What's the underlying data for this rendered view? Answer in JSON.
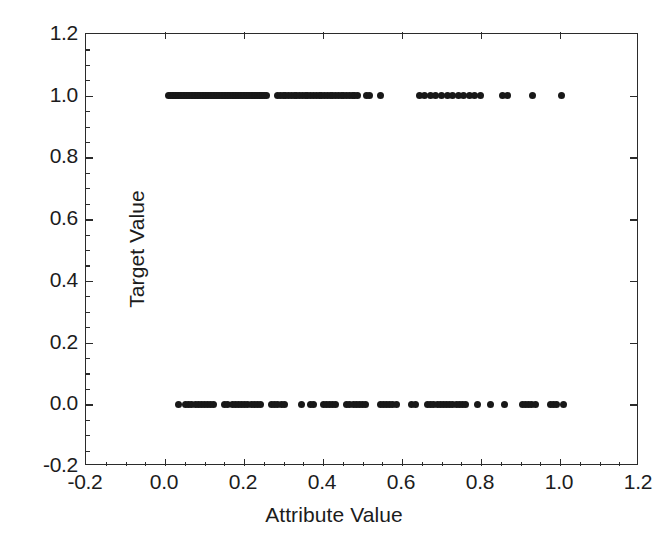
{
  "chart_data": {
    "type": "scatter",
    "title": "",
    "xlabel": "Attribute Value",
    "ylabel": "Target Value",
    "xlim": [
      -0.2,
      1.2
    ],
    "ylim": [
      -0.2,
      1.2
    ],
    "xticks": [
      -0.2,
      0.0,
      0.2,
      0.4,
      0.6,
      0.8,
      1.0,
      1.2
    ],
    "yticks": [
      -0.2,
      0.0,
      0.2,
      0.4,
      0.6,
      0.8,
      1.0,
      1.2
    ],
    "xticklabels": [
      "-0.2",
      "0.0",
      "0.2",
      "0.4",
      "0.6",
      "0.8",
      "1.0",
      "1.2"
    ],
    "yticklabels": [
      "-0.2",
      "0.0",
      "0.2",
      "0.4",
      "0.6",
      "0.8",
      "1.0",
      "1.2"
    ],
    "grid": false,
    "legend": null,
    "marker": "filled-circle",
    "marker_color": "#181818",
    "marker_size": 7,
    "series": [
      {
        "name": "Target = 1",
        "y_value": 1.0,
        "x": [
          0.01,
          0.014,
          0.018,
          0.022,
          0.026,
          0.03,
          0.034,
          0.038,
          0.042,
          0.046,
          0.05,
          0.054,
          0.058,
          0.062,
          0.066,
          0.07,
          0.074,
          0.078,
          0.082,
          0.086,
          0.09,
          0.094,
          0.098,
          0.102,
          0.106,
          0.11,
          0.114,
          0.118,
          0.122,
          0.126,
          0.13,
          0.134,
          0.138,
          0.142,
          0.146,
          0.15,
          0.154,
          0.158,
          0.162,
          0.166,
          0.17,
          0.174,
          0.178,
          0.182,
          0.186,
          0.19,
          0.194,
          0.198,
          0.202,
          0.206,
          0.21,
          0.214,
          0.218,
          0.222,
          0.226,
          0.23,
          0.234,
          0.238,
          0.242,
          0.246,
          0.252,
          0.258,
          0.285,
          0.292,
          0.299,
          0.306,
          0.313,
          0.32,
          0.327,
          0.334,
          0.341,
          0.348,
          0.355,
          0.362,
          0.369,
          0.376,
          0.383,
          0.39,
          0.397,
          0.404,
          0.411,
          0.418,
          0.425,
          0.432,
          0.439,
          0.446,
          0.453,
          0.46,
          0.467,
          0.474,
          0.481,
          0.488,
          0.51,
          0.518,
          0.545,
          0.645,
          0.658,
          0.672,
          0.686,
          0.7,
          0.714,
          0.728,
          0.742,
          0.756,
          0.77,
          0.784,
          0.798,
          0.855,
          0.868,
          0.93,
          1.005
        ],
        "count": 113
      },
      {
        "name": "Target = 0",
        "y_value": 0.0,
        "x": [
          0.033,
          0.052,
          0.06,
          0.068,
          0.076,
          0.084,
          0.092,
          0.1,
          0.108,
          0.116,
          0.124,
          0.15,
          0.158,
          0.17,
          0.178,
          0.186,
          0.194,
          0.202,
          0.21,
          0.218,
          0.226,
          0.234,
          0.242,
          0.27,
          0.278,
          0.286,
          0.294,
          0.302,
          0.345,
          0.368,
          0.376,
          0.4,
          0.408,
          0.416,
          0.424,
          0.432,
          0.46,
          0.468,
          0.476,
          0.484,
          0.492,
          0.5,
          0.508,
          0.545,
          0.553,
          0.561,
          0.569,
          0.577,
          0.585,
          0.625,
          0.633,
          0.665,
          0.673,
          0.681,
          0.689,
          0.697,
          0.705,
          0.713,
          0.721,
          0.729,
          0.737,
          0.745,
          0.753,
          0.761,
          0.79,
          0.825,
          0.86,
          0.905,
          0.913,
          0.921,
          0.929,
          0.937,
          0.975,
          0.983,
          0.991,
          1.01
        ],
        "count": 77
      }
    ]
  },
  "axes": {
    "x_title": "Attribute Value",
    "y_title": "Target Value"
  }
}
